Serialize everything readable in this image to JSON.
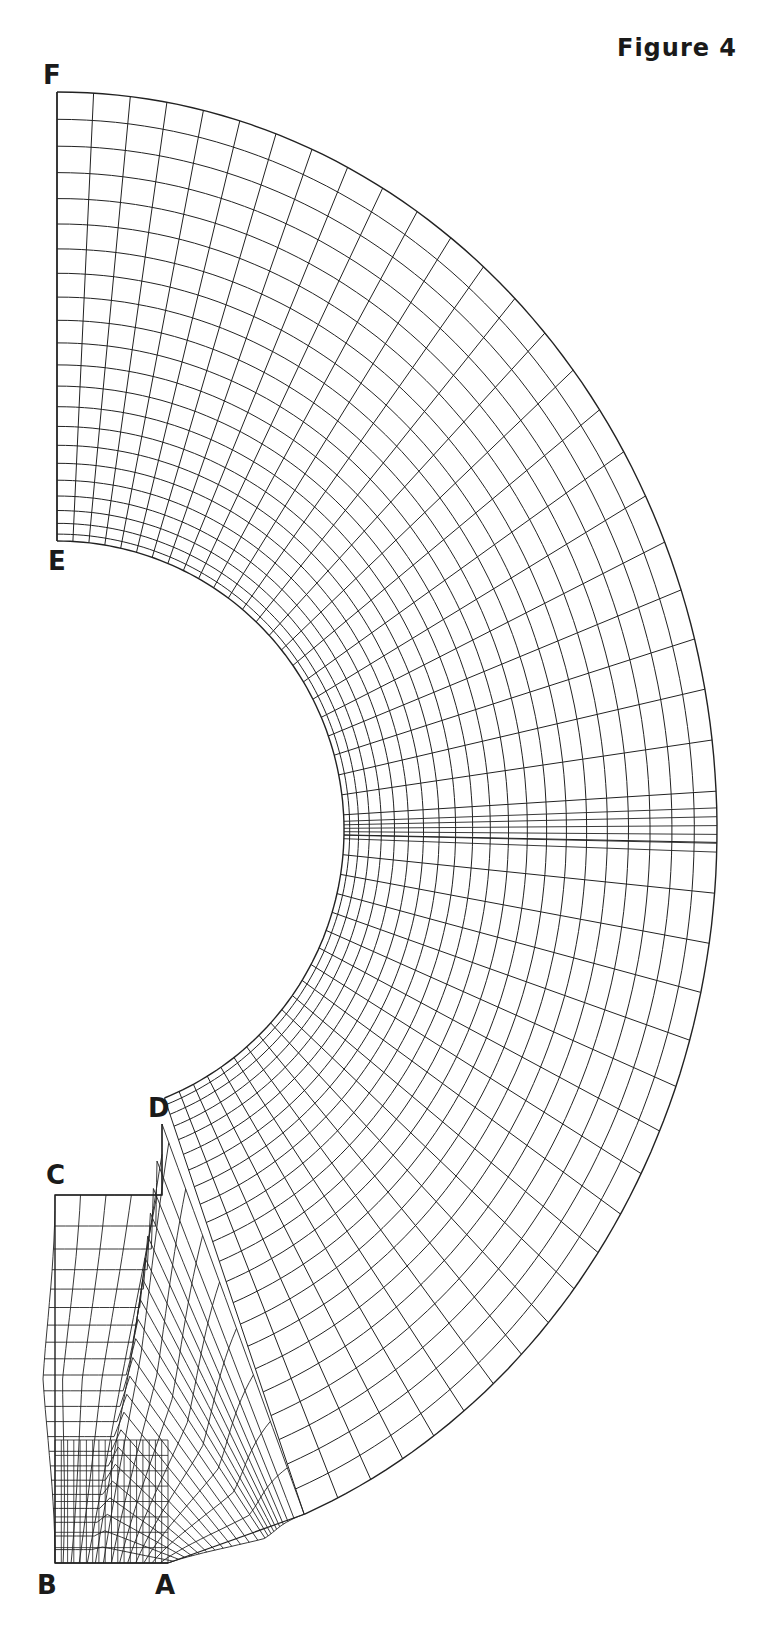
{
  "figure": {
    "title": "Figure 4",
    "ink_color": "#222222",
    "background": "#ffffff"
  },
  "labels": {
    "A": "A",
    "B": "B",
    "C": "C",
    "D": "D",
    "E": "E",
    "F": "F"
  },
  "mesh": {
    "center": [
      57,
      830
    ],
    "inner": {
      "rx": 287,
      "ry": 289
    },
    "outer": {
      "rx": 660,
      "ry": 738
    },
    "arc_count": 22,
    "radial_count": 44,
    "angle_start_deg": -90,
    "angle_end_deg": 68,
    "corner_points": {
      "A": [
        168,
        1563
      ],
      "B": [
        55,
        1563
      ],
      "C": [
        55,
        1195
      ],
      "D": [
        162,
        1124
      ],
      "E": [
        57,
        541
      ],
      "F": [
        57,
        92
      ]
    },
    "foot_rows": 22,
    "foot_cols": 14
  }
}
